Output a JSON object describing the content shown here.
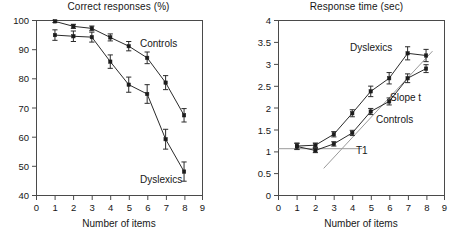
{
  "figure": {
    "background_color": "#ffffff",
    "axis_color": "#4a4a4a",
    "series_color": "#2b2b2b",
    "guide_color": "#9a9a9a"
  },
  "chart_data": [
    {
      "type": "line",
      "panel": "left",
      "title": "Correct responses (%)",
      "xlabel": "Number of items",
      "ylabel": "",
      "xlim": [
        0,
        9
      ],
      "ylim": [
        40,
        100
      ],
      "xticks": [
        0,
        1,
        2,
        3,
        4,
        5,
        6,
        7,
        8,
        9
      ],
      "xtick_labels": [
        "0",
        "1",
        "2",
        "3",
        "4",
        "5",
        "6",
        "7",
        "8",
        "9"
      ],
      "yticks": [
        40,
        50,
        60,
        70,
        80,
        90,
        100
      ],
      "ytick_labels": [
        "40",
        "50",
        "60",
        "70",
        "80",
        "90",
        "100"
      ],
      "grid": false,
      "legend": "inline-annotation",
      "x": [
        1,
        2,
        3,
        4,
        5,
        6,
        7,
        8
      ],
      "series": [
        {
          "name": "Controls",
          "label_text": "Controls",
          "values": [
            99.7,
            98.0,
            97.3,
            94.2,
            91.2,
            87.2,
            78.7,
            67.5
          ],
          "errors": [
            0.4,
            0.7,
            0.8,
            1.2,
            1.6,
            2.0,
            2.4,
            2.3
          ]
        },
        {
          "name": "Dyslexics",
          "label_text": "Dyslexics",
          "values": [
            95.0,
            94.6,
            94.3,
            85.9,
            78.0,
            74.8,
            59.3,
            48.2
          ],
          "errors": [
            1.8,
            1.8,
            1.7,
            2.3,
            2.6,
            3.2,
            3.4,
            3.3
          ]
        }
      ]
    },
    {
      "type": "line",
      "panel": "right",
      "title": "Response time (sec)",
      "xlabel": "Number of items",
      "ylabel": "",
      "xlim": [
        0,
        9
      ],
      "ylim": [
        0,
        4
      ],
      "xticks": [
        0,
        1,
        2,
        3,
        4,
        5,
        6,
        7,
        8,
        9
      ],
      "xtick_labels": [
        "0",
        "1",
        "2",
        "3",
        "4",
        "5",
        "6",
        "7",
        "8",
        "9"
      ],
      "yticks": [
        0,
        0.5,
        1,
        1.5,
        2,
        2.5,
        3,
        3.5,
        4
      ],
      "ytick_labels": [
        "0",
        "0.5",
        "1",
        "1.5",
        "2",
        "2.5",
        "3",
        "3.5",
        "4"
      ],
      "grid": false,
      "legend": "inline-annotation",
      "x": [
        1,
        2,
        3,
        4,
        5,
        6,
        7,
        8
      ],
      "series": [
        {
          "name": "Dyslexics",
          "label_text": "Dyslexics",
          "values": [
            1.13,
            1.15,
            1.4,
            1.88,
            2.38,
            2.68,
            3.25,
            3.2
          ],
          "errors": [
            0.07,
            0.05,
            0.06,
            0.08,
            0.12,
            0.13,
            0.15,
            0.14
          ]
        },
        {
          "name": "Controls",
          "label_text": "Controls",
          "values": [
            1.12,
            1.03,
            1.18,
            1.43,
            1.92,
            2.15,
            2.68,
            2.9
          ],
          "errors": [
            0.07,
            0.05,
            0.05,
            0.06,
            0.07,
            0.08,
            0.1,
            0.09
          ]
        }
      ],
      "annotations": [
        {
          "name": "t1-intercept-line",
          "label_text": "T1",
          "type": "horizontal-line",
          "y_value": 1.07,
          "x_from": 0,
          "x_to": 4.55
        },
        {
          "name": "slope-t-regression-line",
          "label_text": "Slope t",
          "type": "regression-line",
          "x_from": 2.45,
          "y_from": 0.62,
          "x_to": 8.35,
          "y_to": 3.3
        }
      ]
    }
  ]
}
